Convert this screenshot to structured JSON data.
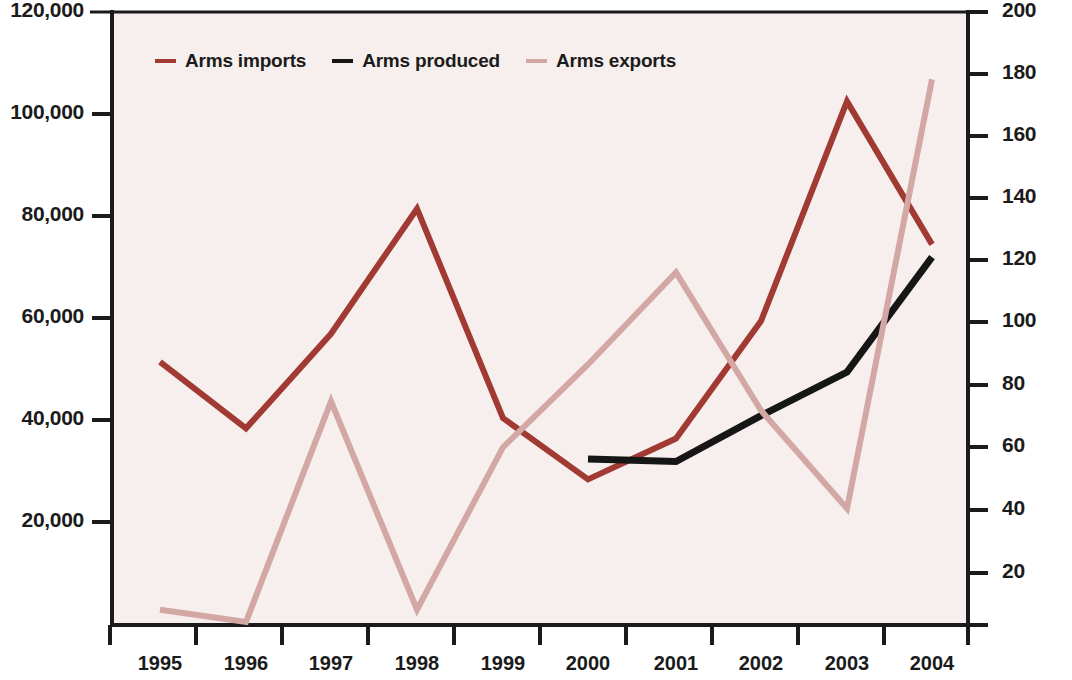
{
  "legend": {
    "position": "top-left-inside",
    "items": [
      {
        "label": "Arms imports",
        "color": "#a03a33"
      },
      {
        "label": "Arms produced",
        "color": "#161616"
      },
      {
        "label": "Arms exports",
        "color": "#d3a7a4"
      }
    ]
  },
  "axes": {
    "left_ticks": [
      "120,000",
      "100,000",
      "80,000",
      "60,000",
      "40,000",
      "20,000"
    ],
    "right_ticks": [
      "200",
      "180",
      "160",
      "140",
      "120",
      "100",
      "80",
      "60",
      "40",
      "20"
    ],
    "x_ticks": [
      "1995",
      "1996",
      "1997",
      "1998",
      "1999",
      "2000",
      "2001",
      "2002",
      "2003",
      "2004"
    ]
  },
  "chart_data": {
    "type": "line",
    "title": "",
    "xlabel": "",
    "ylabel": "",
    "y2label": "",
    "grid": false,
    "legend_position": "top-left-inside",
    "x": [
      1995,
      1996,
      1997,
      1998,
      1999,
      2000,
      2001,
      2002,
      2003,
      2004
    ],
    "xlim": [
      1994.5,
      2004.5
    ],
    "ylim": [
      0,
      120000
    ],
    "y2lim": [
      0,
      200
    ],
    "series": [
      {
        "name": "Arms imports",
        "axis": "left",
        "color": "#a03a33",
        "values": [
          51500,
          38500,
          57000,
          81500,
          40500,
          28500,
          36500,
          59500,
          102500,
          74500
        ]
      },
      {
        "name": "Arms produced",
        "axis": "left",
        "color": "#161616",
        "values": [
          null,
          null,
          null,
          null,
          null,
          32500,
          32000,
          41000,
          49500,
          72000
        ]
      },
      {
        "name": "Arms exports",
        "axis": "right",
        "color": "#d3a7a4",
        "values": [
          5,
          1,
          73,
          5,
          58,
          85,
          115,
          70,
          38,
          178
        ]
      }
    ]
  },
  "geometry": {
    "plot_left": 112,
    "plot_right": 968,
    "plot_top": 12,
    "plot_bottom": 625,
    "x_positions": [
      160,
      246,
      331,
      417,
      503,
      588,
      676,
      761,
      847,
      932
    ],
    "left_tick_y": [
      12,
      114,
      216,
      318,
      420,
      522
    ],
    "right_tick_y": [
      12,
      74,
      136,
      198,
      260,
      322,
      385,
      447,
      510,
      573
    ],
    "x_tick_x": [
      110,
      196,
      282,
      368,
      454,
      540,
      626,
      712,
      798,
      884,
      968
    ]
  }
}
